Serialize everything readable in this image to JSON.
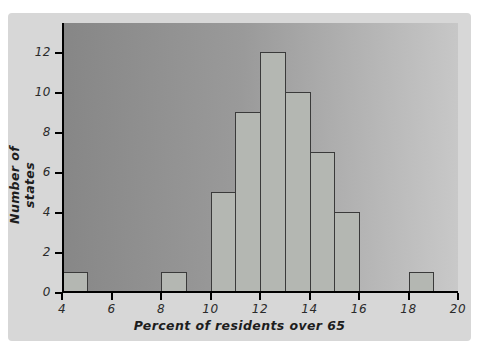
{
  "figure": {
    "page_bg": "#ffffff",
    "panel_bg": "#d7d7d7",
    "plot_gradient_left": "#868686",
    "plot_gradient_right": "#c9c9c9",
    "bar_fill": "#b4b7b2",
    "bar_border": "#3a3a3a",
    "axis_color": "#000000",
    "label_color": "#1d1d1d"
  },
  "chart_data": {
    "type": "bar",
    "chart_kind": "histogram",
    "title": "",
    "xlabel": "Percent of residents over 65",
    "ylabel": "Number of states",
    "xlim": [
      4,
      20
    ],
    "ylim": [
      0,
      13.5
    ],
    "x_ticks": [
      4,
      6,
      8,
      10,
      12,
      14,
      16,
      18,
      20
    ],
    "y_ticks": [
      0,
      2,
      4,
      6,
      8,
      10,
      12
    ],
    "grid": false,
    "legend": false,
    "bins": [
      {
        "x0": 4,
        "x1": 5,
        "count": 1
      },
      {
        "x0": 8,
        "x1": 9,
        "count": 1
      },
      {
        "x0": 10,
        "x1": 11,
        "count": 5
      },
      {
        "x0": 11,
        "x1": 12,
        "count": 9
      },
      {
        "x0": 12,
        "x1": 13,
        "count": 12
      },
      {
        "x0": 13,
        "x1": 14,
        "count": 10
      },
      {
        "x0": 14,
        "x1": 15,
        "count": 7
      },
      {
        "x0": 15,
        "x1": 16,
        "count": 4
      },
      {
        "x0": 18,
        "x1": 19,
        "count": 1
      }
    ]
  }
}
